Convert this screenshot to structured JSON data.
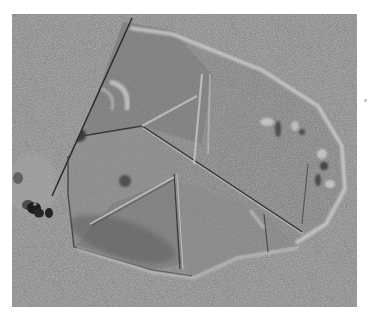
{
  "image": {
    "description": "Grayscale microscopy image of a polygonal 2D crystalline flake with internal grain boundaries on a cracked, textured substrate",
    "palette": {
      "page_background": "#ffffff",
      "substrate": "#8f8f8f",
      "substrate_cracks": "#4a4a4a",
      "substrate_highlights": "#c9c9c9",
      "flake_fill": "#858585",
      "flake_rim": "#d2d2d2",
      "grain_boundary_dark": "#3c3c3c",
      "grain_boundary_light": "#cfcfcf",
      "dark_blobs": "#1e1e1e"
    },
    "regions": {
      "image_bounds": {
        "left": 12,
        "top": 14,
        "width": 345,
        "height": 293
      },
      "flake": "large irregular hexagonal flake spanning center",
      "blobs": "cluster of dark spherical particles at left edge"
    }
  }
}
